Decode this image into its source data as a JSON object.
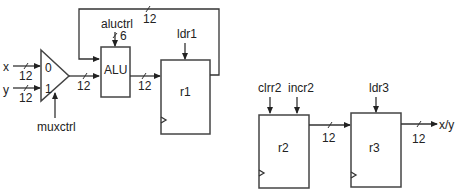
{
  "diagram": {
    "mux": {
      "input0": "0",
      "input1": "1",
      "control": "muxctrl"
    },
    "inputs": {
      "x": "x",
      "y": "y",
      "x_width": "12",
      "y_width": "12"
    },
    "mux_out_width": "12",
    "alu": {
      "label": "ALU",
      "control": "aluctrl",
      "control_width": "6",
      "out_width": "12"
    },
    "feedback_width": "12",
    "r1": {
      "label": "r1",
      "load": "ldr1"
    },
    "r2": {
      "label": "r2",
      "clear": "clrr2",
      "increment": "incr2",
      "out_width": "12"
    },
    "r3": {
      "label": "r3",
      "load": "ldr3",
      "out_width": "12",
      "output": "x/y"
    }
  }
}
